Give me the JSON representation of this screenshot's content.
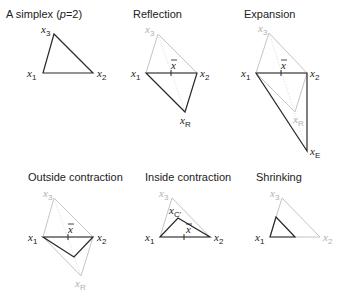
{
  "panels": [
    {
      "id": "simplex",
      "title": "A simplex (p=2)",
      "title_parts": [
        "A simplex (",
        "p",
        "=2)"
      ]
    },
    {
      "id": "reflection",
      "title": "Reflection"
    },
    {
      "id": "expansion",
      "title": "Expansion"
    },
    {
      "id": "outside_contraction",
      "title": "Outside contraction"
    },
    {
      "id": "inside_contraction",
      "title": "Inside contraction"
    },
    {
      "id": "shrinking",
      "title": "Shrinking"
    }
  ],
  "labels": {
    "x": "x",
    "sub1": "1",
    "sub2": "2",
    "sub3": "3",
    "subR": "R",
    "subE": "E",
    "subC": "C'",
    "xbar": "x"
  },
  "colors": {
    "active_line": "#2a2a2a",
    "inactive_line": "#c4c4c4",
    "dotted_line": "#d6d6d6",
    "active_text": "#1a1a1a",
    "inactive_text": "#b0b0b0"
  }
}
